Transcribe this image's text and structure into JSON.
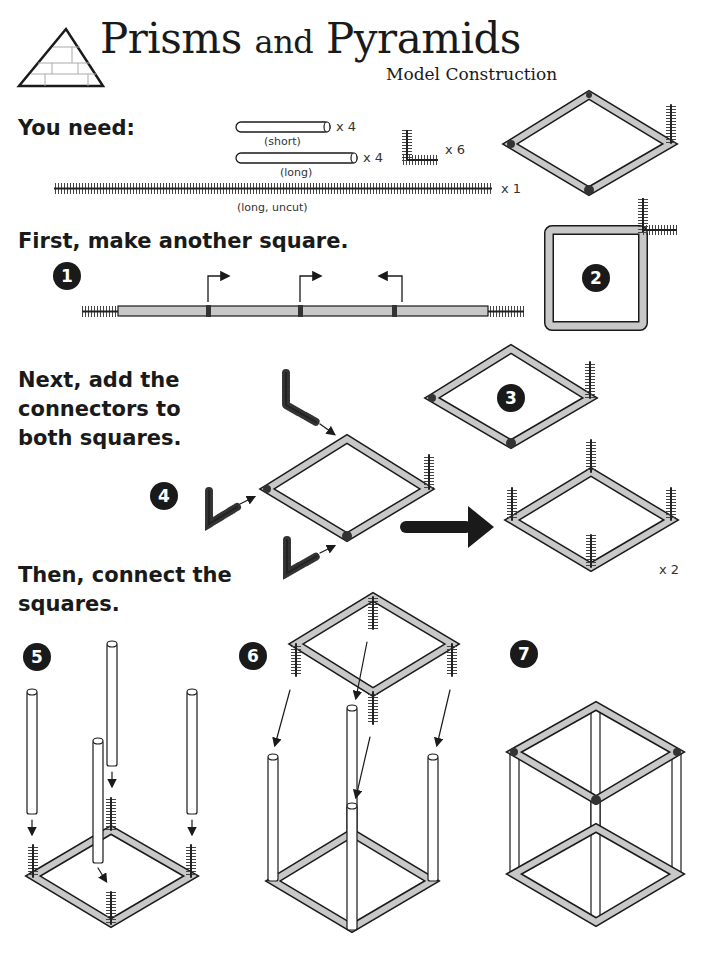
{
  "header": {
    "title_part1": "Prisms",
    "title_part2": "and",
    "title_part3": "Pyramids",
    "subtitle": "Model Construction",
    "logo_icon": "pyramid-brick-icon"
  },
  "materials": {
    "heading": "You need:",
    "items": [
      {
        "name": "straw",
        "label": "(short)",
        "qty": "x 4"
      },
      {
        "name": "straw",
        "label": "(long)",
        "qty": "x 4"
      },
      {
        "name": "pipe-cleaner-connector",
        "label": "",
        "qty": "x 6"
      },
      {
        "name": "pipe-cleaner",
        "label": "(long, uncut)",
        "qty": "x 1"
      }
    ]
  },
  "sections": [
    {
      "heading": "First, make another square."
    },
    {
      "heading_lines": [
        "Next, add the",
        "connectors to",
        "both squares."
      ]
    },
    {
      "heading_lines": [
        "Then, connect the",
        "squares."
      ]
    }
  ],
  "steps": [
    {
      "number": "1"
    },
    {
      "number": "2"
    },
    {
      "number": "3"
    },
    {
      "number": "4"
    },
    {
      "number": "5"
    },
    {
      "number": "6"
    },
    {
      "number": "7"
    }
  ],
  "step4_result": {
    "qty": "x 2"
  },
  "colors": {
    "ink": "#1a1a1a",
    "straw_fill": "#c8c8c8",
    "pipe_cleaner": "#3a3a3a",
    "background": "#ffffff"
  }
}
